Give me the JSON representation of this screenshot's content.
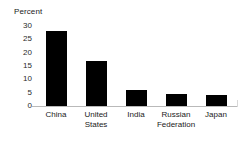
{
  "chart_data": {
    "type": "bar",
    "title": "",
    "subtitle": "",
    "xlabel": "",
    "ylabel": "Percent",
    "categories": [
      "China",
      "United States",
      "India",
      "Russian Federation",
      "Japan"
    ],
    "values": [
      28,
      17,
      6,
      4.5,
      4
    ],
    "series": [
      {
        "name": "Percent",
        "values": [
          28,
          17,
          6,
          4.5,
          4
        ]
      }
    ],
    "ylim": [
      0,
      30
    ],
    "yticks": [
      0,
      5,
      10,
      15,
      20,
      25,
      30
    ],
    "ytick_labels": [
      "0",
      "5",
      "10",
      "15",
      "20",
      "25",
      "30"
    ],
    "grid": false,
    "legend": false,
    "legend_position": "none",
    "bar_color": "#000000",
    "axis_color": "#b9b9b9",
    "annotations": []
  },
  "axis": {
    "y_title": "Percent"
  }
}
